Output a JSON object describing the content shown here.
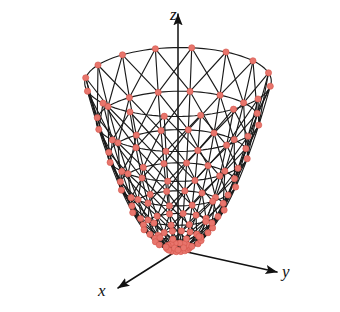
{
  "figure": {
    "title": "",
    "width": 340,
    "height": 312,
    "background_color": "#ffffff"
  },
  "axes": {
    "z": {
      "label": "z",
      "arrow": "up",
      "origin": [
        178,
        250
      ],
      "tip": [
        178,
        14
      ]
    },
    "y": {
      "label": "y",
      "arrow": "right-up",
      "origin": [
        178,
        250
      ],
      "tip": [
        277,
        272
      ]
    },
    "x": {
      "label": "x",
      "arrow": "down-left",
      "origin": [
        178,
        250
      ],
      "tip": [
        118,
        288
      ]
    }
  },
  "style": {
    "point_color": "#e8756c",
    "point_edge_color": "#d4564c",
    "mesh_color": "#1a1a1a",
    "axis_color": "#111111",
    "point_radius": 3.1,
    "mesh_width": 1.15
  },
  "chart_data": {
    "type": "surface",
    "title": "",
    "xlabel": "x",
    "ylabel": "y",
    "zlabel": "z",
    "surface_equation": "z = x^2 + y^2",
    "mesh_kind": "polar",
    "radial_divisions": 8,
    "angular_divisions": 16,
    "radius_max": 1.0,
    "z_at_rim": 1.0,
    "z_at_center": 0.0,
    "vertex_marker": "circle",
    "vertex_marker_color": "#e8756c",
    "grid": true,
    "legend": false,
    "projection": {
      "type": "axonometric",
      "origin_px": [
        178,
        250
      ],
      "x_axis_px_per_unit": [
        -48,
        30
      ],
      "y_axis_px_per_unit": [
        80,
        17
      ],
      "z_axis_px_per_unit": [
        0,
        -168
      ],
      "elevation_deg": 18,
      "azimuth_deg": 35
    },
    "rings_r": [
      0.125,
      0.25,
      0.375,
      0.5,
      0.625,
      0.75,
      0.875,
      1.0
    ],
    "rings_z": [
      0.0156,
      0.0625,
      0.1406,
      0.25,
      0.3906,
      0.5625,
      0.7656,
      1.0
    ],
    "spoke_angles_deg": [
      0,
      22.5,
      45,
      67.5,
      90,
      112.5,
      135,
      157.5,
      180,
      202.5,
      225,
      247.5,
      270,
      292.5,
      315,
      337.5
    ]
  }
}
